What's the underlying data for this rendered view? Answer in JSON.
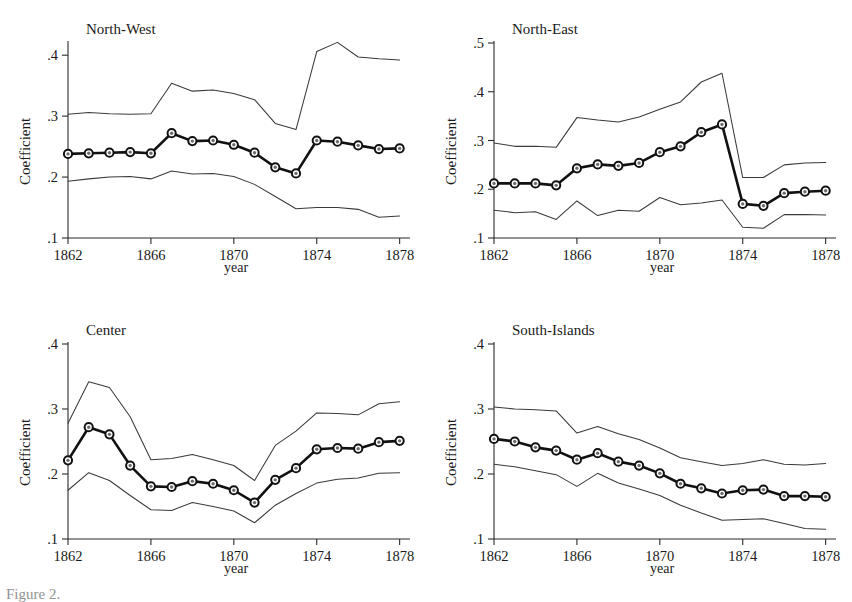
{
  "figure": {
    "background": "#ffffff",
    "line_color": "#111111",
    "ci_color": "#3a3a3a",
    "marker_fill": "#6d6d6d",
    "caption_partial": "Figure 2."
  },
  "chart_data": [
    {
      "type": "line",
      "title": "North-West",
      "xlabel": "year",
      "ylabel": "Coefficient",
      "xlim": [
        1862,
        1878.5
      ],
      "ylim": [
        0.1,
        0.42
      ],
      "xticks": [
        1862,
        1866,
        1870,
        1874,
        1878
      ],
      "xtick_labels": [
        "1862",
        "1866",
        "1870",
        "1874",
        "1878"
      ],
      "yticks": [
        0.1,
        0.2,
        0.3,
        0.4
      ],
      "ytick_labels": [
        ".1",
        ".2",
        ".3",
        ".4"
      ],
      "grid": false,
      "legend": "none",
      "x": [
        1862,
        1862.5,
        1863,
        1863.5,
        1864,
        1864.5,
        1865,
        1865.5,
        1866,
        1866.5,
        1867,
        1867.5,
        1868,
        1868.5,
        1869,
        1869.5,
        1870,
        1870.5,
        1871,
        1871.5,
        1872,
        1872.5,
        1873,
        1873.5,
        1874,
        1874.5,
        1875,
        1875.5,
        1876,
        1876.5,
        1877,
        1877.5,
        1878
      ],
      "series": [
        {
          "name": "Coefficient",
          "marker_x": [
            1862,
            1863,
            1864,
            1865,
            1866,
            1867,
            1868,
            1869,
            1870,
            1871,
            1872,
            1873,
            1874,
            1875,
            1876,
            1877,
            1878
          ],
          "values": [
            0.238,
            0.239,
            0.24,
            0.241,
            0.239,
            0.272,
            0.259,
            0.26,
            0.253,
            0.24,
            0.216,
            0.206,
            0.26,
            0.258,
            0.252,
            0.246,
            0.247
          ]
        },
        {
          "name": "Upper CI",
          "marker_x": [
            1862,
            1863,
            1864,
            1865,
            1866,
            1867,
            1868,
            1869,
            1870,
            1871,
            1872,
            1873,
            1874,
            1875,
            1876,
            1877,
            1878
          ],
          "values": [
            0.303,
            0.306,
            0.304,
            0.303,
            0.304,
            0.354,
            0.341,
            0.343,
            0.337,
            0.327,
            0.288,
            0.278,
            0.406,
            0.421,
            0.397,
            0.394,
            0.392
          ]
        },
        {
          "name": "Lower CI",
          "marker_x": [
            1862,
            1863,
            1864,
            1865,
            1866,
            1867,
            1868,
            1869,
            1870,
            1871,
            1872,
            1873,
            1874,
            1875,
            1876,
            1877,
            1878
          ],
          "values": [
            0.193,
            0.197,
            0.2,
            0.201,
            0.197,
            0.21,
            0.205,
            0.206,
            0.201,
            0.188,
            0.168,
            0.148,
            0.15,
            0.15,
            0.147,
            0.134,
            0.136
          ]
        }
      ]
    },
    {
      "type": "line",
      "title": "North-East",
      "xlabel": "year",
      "ylabel": "Coefficient",
      "xlim": [
        1862,
        1878.5
      ],
      "ylim": [
        0.1,
        0.5
      ],
      "xticks": [
        1862,
        1866,
        1870,
        1874,
        1878
      ],
      "xtick_labels": [
        "1862",
        "1866",
        "1870",
        "1874",
        "1878"
      ],
      "yticks": [
        0.1,
        0.2,
        0.3,
        0.4,
        0.5
      ],
      "ytick_labels": [
        ".1",
        ".2",
        ".3",
        ".4",
        ".5"
      ],
      "grid": false,
      "legend": "none",
      "series": [
        {
          "name": "Coefficient",
          "marker_x": [
            1862,
            1863,
            1864,
            1865,
            1866,
            1867,
            1868,
            1869,
            1870,
            1871,
            1872,
            1873,
            1874,
            1875,
            1876,
            1877,
            1878
          ],
          "values": [
            0.212,
            0.212,
            0.212,
            0.208,
            0.243,
            0.251,
            0.248,
            0.254,
            0.276,
            0.288,
            0.317,
            0.333,
            0.17,
            0.166,
            0.192,
            0.195,
            0.197
          ]
        },
        {
          "name": "Upper CI",
          "marker_x": [
            1862,
            1863,
            1864,
            1865,
            1866,
            1867,
            1868,
            1869,
            1870,
            1871,
            1872,
            1873,
            1874,
            1875,
            1876,
            1877,
            1878
          ],
          "values": [
            0.295,
            0.288,
            0.288,
            0.286,
            0.347,
            0.342,
            0.338,
            0.348,
            0.364,
            0.379,
            0.42,
            0.438,
            0.224,
            0.224,
            0.25,
            0.254,
            0.255
          ]
        },
        {
          "name": "Lower CI",
          "marker_x": [
            1862,
            1863,
            1864,
            1865,
            1866,
            1867,
            1868,
            1869,
            1870,
            1871,
            1872,
            1873,
            1874,
            1875,
            1876,
            1877,
            1878
          ],
          "values": [
            0.157,
            0.152,
            0.154,
            0.138,
            0.176,
            0.146,
            0.157,
            0.155,
            0.183,
            0.168,
            0.172,
            0.178,
            0.122,
            0.12,
            0.148,
            0.148,
            0.147
          ]
        }
      ]
    },
    {
      "type": "line",
      "title": "Center",
      "xlabel": "year",
      "ylabel": "Coefficient",
      "xlim": [
        1862,
        1878.5
      ],
      "ylim": [
        0.1,
        0.4
      ],
      "xticks": [
        1862,
        1866,
        1870,
        1874,
        1878
      ],
      "xtick_labels": [
        "1862",
        "1866",
        "1870",
        "1874",
        "1878"
      ],
      "yticks": [
        0.1,
        0.2,
        0.3,
        0.4
      ],
      "ytick_labels": [
        ".1",
        ".2",
        ".3",
        ".4"
      ],
      "grid": false,
      "legend": "none",
      "series": [
        {
          "name": "Coefficient",
          "marker_x": [
            1862,
            1863,
            1864,
            1865,
            1866,
            1867,
            1868,
            1869,
            1870,
            1871,
            1872,
            1873,
            1874,
            1875,
            1876,
            1877,
            1878
          ],
          "values": [
            0.221,
            0.272,
            0.261,
            0.213,
            0.181,
            0.18,
            0.189,
            0.185,
            0.175,
            0.156,
            0.191,
            0.209,
            0.238,
            0.24,
            0.239,
            0.249,
            0.251
          ]
        },
        {
          "name": "Upper CI",
          "marker_x": [
            1862,
            1863,
            1864,
            1865,
            1866,
            1867,
            1868,
            1869,
            1870,
            1871,
            1872,
            1873,
            1874,
            1875,
            1876,
            1877,
            1878
          ],
          "values": [
            0.278,
            0.342,
            0.333,
            0.288,
            0.222,
            0.224,
            0.23,
            0.222,
            0.213,
            0.19,
            0.244,
            0.266,
            0.294,
            0.293,
            0.291,
            0.308,
            0.311
          ]
        },
        {
          "name": "Lower CI",
          "marker_x": [
            1862,
            1863,
            1864,
            1865,
            1866,
            1867,
            1868,
            1869,
            1870,
            1871,
            1872,
            1873,
            1874,
            1875,
            1876,
            1877,
            1878
          ],
          "values": [
            0.175,
            0.202,
            0.19,
            0.167,
            0.145,
            0.144,
            0.156,
            0.15,
            0.143,
            0.125,
            0.152,
            0.17,
            0.186,
            0.192,
            0.194,
            0.201,
            0.202
          ]
        }
      ]
    },
    {
      "type": "line",
      "title": "South-Islands",
      "xlabel": "year",
      "ylabel": "Coefficient",
      "xlim": [
        1862,
        1878.5
      ],
      "ylim": [
        0.1,
        0.4
      ],
      "xticks": [
        1862,
        1866,
        1870,
        1874,
        1878
      ],
      "xtick_labels": [
        "1862",
        "1866",
        "1870",
        "1874",
        "1878"
      ],
      "yticks": [
        0.1,
        0.2,
        0.3,
        0.4
      ],
      "ytick_labels": [
        ".1",
        ".2",
        ".3",
        ".4"
      ],
      "grid": false,
      "legend": "none",
      "series": [
        {
          "name": "Coefficient",
          "marker_x": [
            1862,
            1863,
            1864,
            1865,
            1866,
            1867,
            1868,
            1869,
            1870,
            1871,
            1872,
            1873,
            1874,
            1875,
            1876,
            1877,
            1878
          ],
          "values": [
            0.254,
            0.25,
            0.241,
            0.236,
            0.222,
            0.232,
            0.219,
            0.213,
            0.201,
            0.185,
            0.178,
            0.17,
            0.175,
            0.176,
            0.166,
            0.166,
            0.165
          ]
        },
        {
          "name": "Upper CI",
          "marker_x": [
            1862,
            1863,
            1864,
            1865,
            1866,
            1867,
            1868,
            1869,
            1870,
            1871,
            1872,
            1873,
            1874,
            1875,
            1876,
            1877,
            1878
          ],
          "values": [
            0.303,
            0.3,
            0.299,
            0.297,
            0.263,
            0.273,
            0.262,
            0.253,
            0.24,
            0.225,
            0.219,
            0.213,
            0.216,
            0.222,
            0.215,
            0.214,
            0.216
          ]
        },
        {
          "name": "Lower CI",
          "marker_x": [
            1862,
            1863,
            1864,
            1865,
            1866,
            1867,
            1868,
            1869,
            1870,
            1871,
            1872,
            1873,
            1874,
            1875,
            1876,
            1877,
            1878
          ],
          "values": [
            0.215,
            0.211,
            0.205,
            0.199,
            0.181,
            0.201,
            0.186,
            0.177,
            0.167,
            0.152,
            0.14,
            0.129,
            0.13,
            0.131,
            0.124,
            0.116,
            0.115
          ]
        }
      ]
    }
  ]
}
